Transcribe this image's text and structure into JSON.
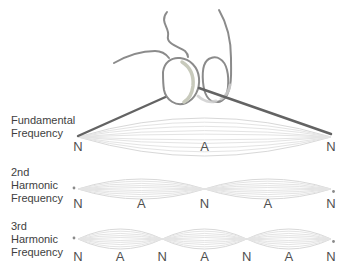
{
  "diagram": {
    "type": "standing-waves-on-plucked-string",
    "rows": [
      {
        "label_lines": [
          "Fundamental",
          "Frequency",
          ""
        ],
        "harmonic": 1,
        "markers": [
          "N",
          "A",
          "N"
        ]
      },
      {
        "label_lines": [
          "2nd",
          "Harmonic",
          "Frequency"
        ],
        "harmonic": 2,
        "markers": [
          "N",
          "A",
          "N",
          "A",
          "N"
        ]
      },
      {
        "label_lines": [
          "3rd",
          "Harmonic",
          "Frequency"
        ],
        "harmonic": 3,
        "markers": [
          "N",
          "A",
          "N",
          "A",
          "N",
          "A",
          "N"
        ]
      }
    ],
    "colors": {
      "background": "#ffffff",
      "string": "#636363",
      "hand_outline": "#8b8b8b",
      "nail_shade": "#c8cabc",
      "envelope_inner": "#e4e4e4",
      "envelope_outer": "#d8d8d8",
      "label_text": "#3e3e3e",
      "marker_text": "#4f4f4f",
      "end_dot": "#8a8a8a"
    }
  }
}
